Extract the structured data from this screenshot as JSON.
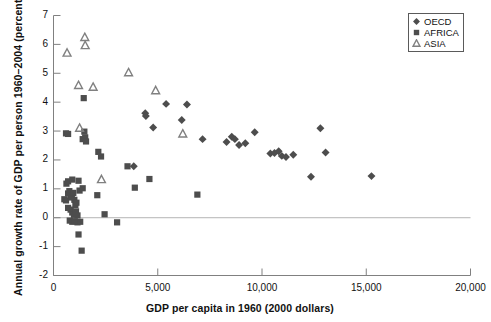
{
  "chart_data": {
    "type": "scatter",
    "title": "",
    "xlabel": "GDP per capita in 1960 (2000 dollars)",
    "ylabel": "Annual growth rate of GDP per person 1960–2004 (percent)",
    "xlim": [
      0,
      20000
    ],
    "ylim": [
      -2,
      7
    ],
    "xticks": [
      0,
      5000,
      10000,
      15000,
      20000
    ],
    "xtick_labels": [
      "0",
      "5,000",
      "10,000",
      "15,000",
      "20,000"
    ],
    "yticks": [
      -2,
      -1,
      0,
      1,
      2,
      3,
      4,
      5,
      6,
      7
    ],
    "ytick_labels": [
      "-2",
      "-1",
      "0",
      "1",
      "2",
      "3",
      "4",
      "5",
      "6",
      "7"
    ],
    "grid": false,
    "zero_line": true,
    "legend_position": "top-right",
    "marker_color": "#4d4d4d",
    "axis_color": "#808080",
    "series": [
      {
        "name": "OECD",
        "marker": "diamond",
        "color": "#4d4d4d",
        "points": [
          [
            3850,
            1.78
          ],
          [
            4400,
            3.62
          ],
          [
            4430,
            3.52
          ],
          [
            4780,
            3.12
          ],
          [
            5400,
            3.94
          ],
          [
            6150,
            3.38
          ],
          [
            6400,
            3.92
          ],
          [
            7150,
            2.72
          ],
          [
            8300,
            2.62
          ],
          [
            8550,
            2.8
          ],
          [
            8700,
            2.72
          ],
          [
            8900,
            2.52
          ],
          [
            9200,
            2.58
          ],
          [
            9650,
            2.96
          ],
          [
            10400,
            2.22
          ],
          [
            10600,
            2.24
          ],
          [
            10800,
            2.3
          ],
          [
            10950,
            2.14
          ],
          [
            11150,
            2.1
          ],
          [
            11500,
            2.18
          ],
          [
            12350,
            1.42
          ],
          [
            12800,
            3.1
          ],
          [
            13050,
            2.26
          ],
          [
            15250,
            1.44
          ]
        ]
      },
      {
        "name": "AFRICA",
        "marker": "square",
        "color": "#4d4d4d",
        "points": [
          [
            600,
            2.92
          ],
          [
            700,
            2.9
          ],
          [
            1450,
            4.14
          ],
          [
            1400,
            2.72
          ],
          [
            1480,
            2.98
          ],
          [
            1520,
            2.78
          ],
          [
            1560,
            2.64
          ],
          [
            2150,
            2.28
          ],
          [
            2280,
            2.12
          ],
          [
            620,
            1.18
          ],
          [
            700,
            1.26
          ],
          [
            900,
            1.32
          ],
          [
            1200,
            1.28
          ],
          [
            1250,
            0.94
          ],
          [
            520,
            0.64
          ],
          [
            600,
            0.6
          ],
          [
            700,
            0.84
          ],
          [
            760,
            0.92
          ],
          [
            820,
            0.78
          ],
          [
            880,
            0.7
          ],
          [
            950,
            0.86
          ],
          [
            1000,
            0.62
          ],
          [
            1050,
            0.44
          ],
          [
            1100,
            0.52
          ],
          [
            700,
            0.34
          ],
          [
            820,
            0.28
          ],
          [
            900,
            0.18
          ],
          [
            980,
            0.1
          ],
          [
            1080,
            0.22
          ],
          [
            1150,
            0.08
          ],
          [
            780,
            -0.1
          ],
          [
            900,
            -0.14
          ],
          [
            1020,
            -0.12
          ],
          [
            1150,
            -0.16
          ],
          [
            1280,
            -0.14
          ],
          [
            1200,
            -0.58
          ],
          [
            1350,
            -1.14
          ],
          [
            1400,
            1.02
          ],
          [
            2100,
            0.78
          ],
          [
            2450,
            0.12
          ],
          [
            3050,
            -0.16
          ],
          [
            3550,
            1.78
          ],
          [
            3900,
            1.04
          ],
          [
            4600,
            1.34
          ],
          [
            6900,
            0.8
          ]
        ]
      },
      {
        "name": "ASIA",
        "marker": "triangle",
        "color": "#808080",
        "points": [
          [
            1500,
            6.24
          ],
          [
            1520,
            5.96
          ],
          [
            650,
            5.7
          ],
          [
            3600,
            5.02
          ],
          [
            1200,
            4.58
          ],
          [
            1900,
            4.52
          ],
          [
            4900,
            4.4
          ],
          [
            1250,
            3.1
          ],
          [
            6200,
            2.9
          ],
          [
            2300,
            1.32
          ]
        ]
      }
    ]
  },
  "legend": {
    "items": [
      {
        "label": "OECD",
        "marker": "diamond-marker"
      },
      {
        "label": "AFRICA",
        "marker": "square-marker"
      },
      {
        "label": "ASIA",
        "marker": "triangle-marker"
      }
    ]
  }
}
